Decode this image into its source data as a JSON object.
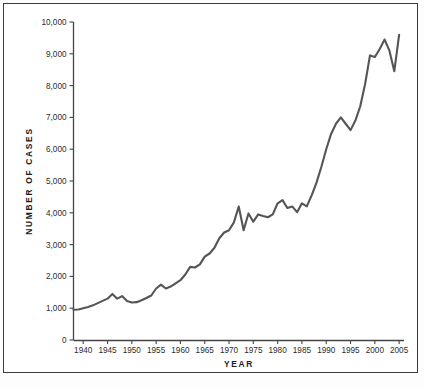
{
  "chart_data": {
    "type": "line",
    "title": "",
    "xlabel": "YEAR",
    "ylabel": "NUMBER OF CASES",
    "xlim": [
      1938,
      2006
    ],
    "ylim": [
      0,
      10000
    ],
    "grid": false,
    "legend": false,
    "line_color": "#555555",
    "frame_color": "#3a3a3a",
    "background": "#ffffff",
    "xticks": [
      1940,
      1945,
      1950,
      1955,
      1960,
      1965,
      1970,
      1975,
      1980,
      1985,
      1990,
      1995,
      2000,
      2005
    ],
    "xtick_labels": [
      "1940",
      "1945",
      "1950",
      "1955",
      "1960",
      "1965",
      "1970",
      "1975",
      "1980",
      "1985",
      "1990",
      "1995",
      "2000",
      "2005"
    ],
    "yticks": [
      0,
      1000,
      2000,
      3000,
      4000,
      5000,
      6000,
      7000,
      8000,
      9000,
      10000
    ],
    "ytick_labels": [
      "0",
      "1,000",
      "2,000",
      "3,000",
      "4,000",
      "5,000",
      "6,000",
      "7,000",
      "8,000",
      "9,000",
      "10,000"
    ],
    "x": [
      1938,
      1939,
      1940,
      1941,
      1942,
      1943,
      1944,
      1945,
      1946,
      1947,
      1948,
      1949,
      1950,
      1951,
      1952,
      1953,
      1954,
      1955,
      1956,
      1957,
      1958,
      1959,
      1960,
      1961,
      1962,
      1963,
      1964,
      1965,
      1966,
      1967,
      1968,
      1969,
      1970,
      1971,
      1972,
      1973,
      1974,
      1975,
      1976,
      1977,
      1978,
      1979,
      1980,
      1981,
      1982,
      1983,
      1984,
      1985,
      1986,
      1987,
      1988,
      1989,
      1990,
      1991,
      1992,
      1993,
      1994,
      1995,
      1996,
      1997,
      1998,
      1999,
      2000,
      2001,
      2002,
      2003,
      2004,
      2005
    ],
    "values": [
      950,
      960,
      1000,
      1040,
      1090,
      1160,
      1230,
      1300,
      1450,
      1300,
      1380,
      1230,
      1180,
      1190,
      1250,
      1320,
      1400,
      1620,
      1740,
      1620,
      1680,
      1780,
      1880,
      2060,
      2300,
      2280,
      2380,
      2620,
      2720,
      2900,
      3200,
      3380,
      3450,
      3700,
      4200,
      3450,
      3980,
      3720,
      3950,
      3900,
      3860,
      3950,
      4300,
      4400,
      4150,
      4200,
      4020,
      4300,
      4200,
      4550,
      4950,
      5450,
      6000,
      6480,
      6800,
      7000,
      6800,
      6600,
      6900,
      7350,
      8050,
      8950,
      8900,
      9150,
      9450,
      9100,
      8450,
      9600
    ],
    "series_name": "Number of cases"
  },
  "axis": {
    "y_title": "NUMBER OF CASES",
    "x_title": "YEAR"
  }
}
